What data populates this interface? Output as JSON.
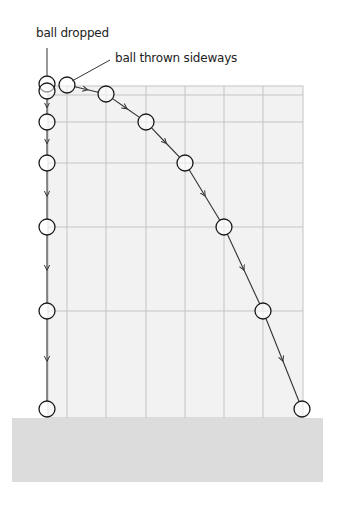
{
  "figure": {
    "labels": {
      "dropped": "ball dropped",
      "thrown": "ball thrown sideways"
    },
    "colors": {
      "background": "#ffffff",
      "grid_fill": "#f2f2f2",
      "grid_line": "#c4c4c4",
      "ground": "#dcdcdc",
      "ball_stroke": "#1a1a1a",
      "path_stroke": "#333333"
    },
    "grid": {
      "x": 48,
      "y": 86,
      "right": 303,
      "bottom": 418,
      "vertical_lines": [
        67,
        106,
        146,
        185,
        224,
        263
      ],
      "horizontal_lines": [
        95,
        122,
        163,
        227,
        311
      ]
    },
    "ground": {
      "x": 12,
      "y": 418,
      "width": 311,
      "height": 64
    },
    "ball_radius": 8,
    "dropped_balls": [
      {
        "x": 47,
        "y": 84
      },
      {
        "x": 47,
        "y": 91
      },
      {
        "x": 47,
        "y": 122
      },
      {
        "x": 47,
        "y": 163
      },
      {
        "x": 47,
        "y": 227
      },
      {
        "x": 47,
        "y": 311
      },
      {
        "x": 47,
        "y": 409
      }
    ],
    "thrown_balls": [
      {
        "x": 67,
        "y": 85
      },
      {
        "x": 106,
        "y": 94
      },
      {
        "x": 146,
        "y": 122
      },
      {
        "x": 185,
        "y": 163
      },
      {
        "x": 224,
        "y": 227
      },
      {
        "x": 263,
        "y": 311
      },
      {
        "x": 302,
        "y": 409
      }
    ]
  }
}
